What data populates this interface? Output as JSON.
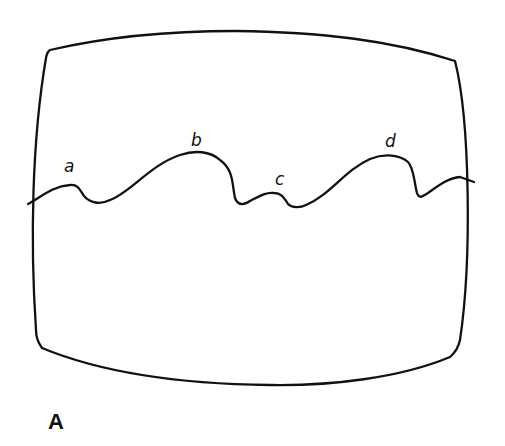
{
  "figure": {
    "panel_label": "A",
    "peak_labels": [
      {
        "id": "a",
        "text": "a",
        "x": 64,
        "y": 158
      },
      {
        "id": "b",
        "text": "b",
        "x": 191,
        "y": 132
      },
      {
        "id": "c",
        "text": "c",
        "x": 275,
        "y": 171
      },
      {
        "id": "d",
        "text": "d",
        "x": 385,
        "y": 133
      }
    ],
    "colors": {
      "line": "#111111",
      "background": "#ffffff"
    }
  }
}
